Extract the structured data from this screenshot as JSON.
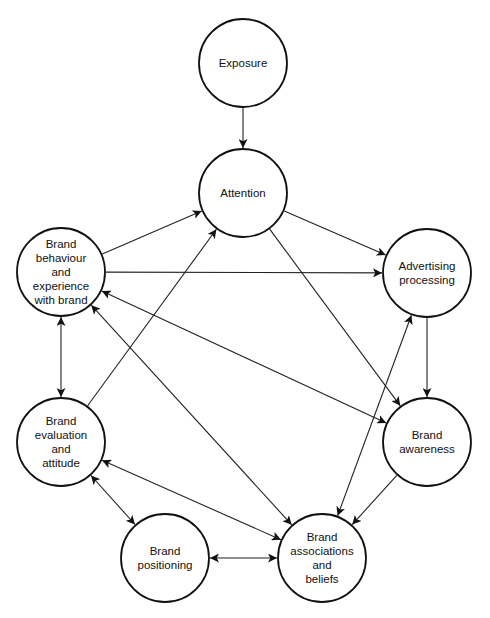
{
  "diagram": {
    "type": "flow diagram",
    "nodes": [
      {
        "id": "exposure",
        "lines": [
          "Exposure"
        ],
        "x": 243,
        "y": 63,
        "r": 44
      },
      {
        "id": "attention",
        "lines": [
          "Attention"
        ],
        "x": 243,
        "y": 193,
        "r": 44
      },
      {
        "id": "behaviour",
        "lines": [
          "Brand",
          "behaviour",
          "and",
          "experience",
          "with brand"
        ],
        "x": 61,
        "y": 272,
        "r": 44
      },
      {
        "id": "advertising",
        "lines": [
          "Advertising",
          "processing"
        ],
        "x": 427,
        "y": 273,
        "r": 44
      },
      {
        "id": "evaluation",
        "lines": [
          "Brand",
          "evaluation",
          "and",
          "attitude"
        ],
        "x": 61,
        "y": 442,
        "r": 44
      },
      {
        "id": "awareness",
        "lines": [
          "Brand",
          "awareness"
        ],
        "x": 427,
        "y": 442,
        "r": 44
      },
      {
        "id": "positioning",
        "lines": [
          "Brand",
          "positioning"
        ],
        "x": 165,
        "y": 558,
        "r": 44
      },
      {
        "id": "associations",
        "lines": [
          "Brand",
          "associations",
          "and",
          "beliefs"
        ],
        "x": 322,
        "y": 558,
        "r": 44
      }
    ],
    "edges": [
      {
        "from": "exposure",
        "to": "attention",
        "bidirectional": false
      },
      {
        "from": "behaviour",
        "to": "attention",
        "bidirectional": false
      },
      {
        "from": "attention",
        "to": "advertising",
        "bidirectional": false
      },
      {
        "from": "behaviour",
        "to": "advertising",
        "bidirectional": false
      },
      {
        "from": "attention",
        "to": "awareness",
        "bidirectional": false
      },
      {
        "from": "advertising",
        "to": "awareness",
        "bidirectional": false
      },
      {
        "from": "behaviour",
        "to": "evaluation",
        "bidirectional": true
      },
      {
        "from": "evaluation",
        "to": "attention",
        "bidirectional": false
      },
      {
        "from": "associations",
        "to": "behaviour",
        "bidirectional": true
      },
      {
        "from": "awareness",
        "to": "behaviour",
        "bidirectional": true
      },
      {
        "from": "associations",
        "to": "advertising",
        "bidirectional": true
      },
      {
        "from": "awareness",
        "to": "associations",
        "bidirectional": false
      },
      {
        "from": "associations",
        "to": "evaluation",
        "bidirectional": true
      },
      {
        "from": "evaluation",
        "to": "positioning",
        "bidirectional": true
      },
      {
        "from": "positioning",
        "to": "associations",
        "bidirectional": true
      }
    ]
  }
}
